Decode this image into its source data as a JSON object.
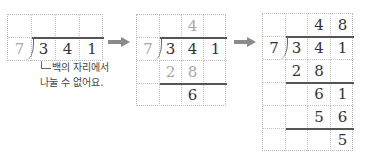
{
  "steps": [
    {
      "id": "step1",
      "divisor": "7",
      "rows": [
        [
          "",
          "",
          "",
          ""
        ],
        [
          "7",
          "3",
          "4",
          "1"
        ]
      ],
      "annotation": {
        "line1": "백의 자리에서",
        "line2": "나눌 수 없어요."
      }
    },
    {
      "id": "step2",
      "rows": [
        [
          "",
          "",
          "4",
          ""
        ],
        [
          "7",
          "3",
          "4",
          "1"
        ],
        [
          "",
          "2",
          "8",
          ""
        ],
        [
          "",
          "",
          "6",
          ""
        ]
      ]
    },
    {
      "id": "step3",
      "rows": [
        [
          "",
          "",
          "4",
          "8"
        ],
        [
          "7",
          "3",
          "4",
          "1"
        ],
        [
          "",
          "2",
          "8",
          ""
        ],
        [
          "",
          "",
          "6",
          "1"
        ],
        [
          "",
          "",
          "5",
          "6"
        ],
        [
          "",
          "",
          "",
          "5"
        ]
      ]
    }
  ],
  "arrows": [
    "right-arrow",
    "right-arrow"
  ],
  "colors": {
    "text": "#333333",
    "faded": "#a8a8a8",
    "arrow": "#8a8a8a",
    "grid": "#c4c4c4"
  }
}
